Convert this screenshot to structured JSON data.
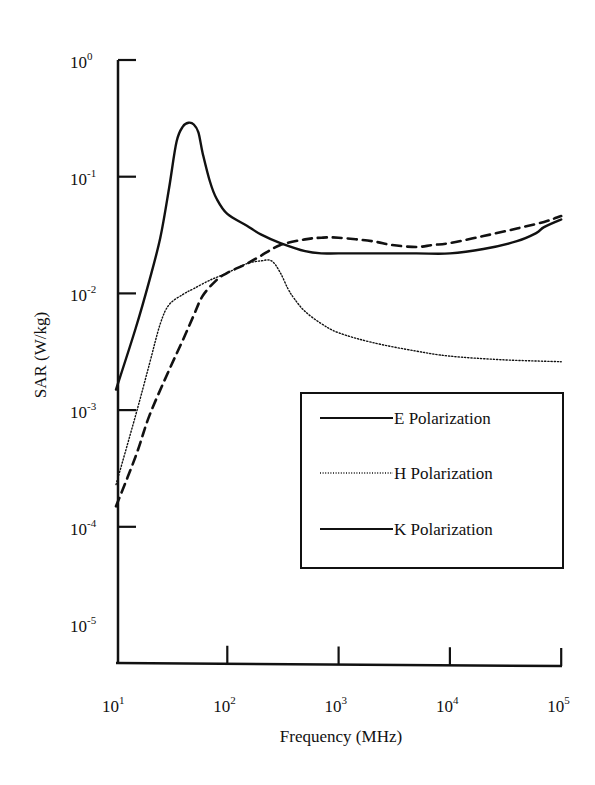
{
  "chart_data": {
    "type": "line",
    "title": "",
    "xlabel": "Frequency (MHz)",
    "ylabel": "SAR (W/kg)",
    "xscale": "log",
    "yscale": "log",
    "xlim": [
      10,
      100000
    ],
    "ylim": [
      1e-05,
      1
    ],
    "x_ticks": [
      {
        "value": 10,
        "base": "10",
        "exp": "1"
      },
      {
        "value": 100,
        "base": "10",
        "exp": "2"
      },
      {
        "value": 1000,
        "base": "10",
        "exp": "3"
      },
      {
        "value": 10000,
        "base": "10",
        "exp": "4"
      },
      {
        "value": 100000,
        "base": "10",
        "exp": "5"
      }
    ],
    "y_ticks": [
      {
        "value": 1,
        "base": "10",
        "exp": "0"
      },
      {
        "value": 0.1,
        "base": "10",
        "exp": "-1"
      },
      {
        "value": 0.01,
        "base": "10",
        "exp": "-2"
      },
      {
        "value": 0.001,
        "base": "10",
        "exp": "-3"
      },
      {
        "value": 0.0001,
        "base": "10",
        "exp": "-4"
      },
      {
        "value": 1e-05,
        "base": "10",
        "exp": "-5"
      }
    ],
    "grid": false,
    "legend_position": "lower-right inside",
    "series": [
      {
        "name": "E Polarization",
        "style": "solid",
        "x": [
          10,
          15,
          20,
          25,
          30,
          35,
          40,
          45,
          50,
          55,
          60,
          70,
          80,
          100,
          150,
          200,
          300,
          500,
          700,
          1000,
          2000,
          5000,
          10000,
          20000,
          40000,
          60000,
          70000,
          100000
        ],
        "y": [
          0.0015,
          0.005,
          0.013,
          0.03,
          0.08,
          0.2,
          0.27,
          0.29,
          0.28,
          0.24,
          0.16,
          0.09,
          0.065,
          0.048,
          0.038,
          0.032,
          0.027,
          0.023,
          0.022,
          0.022,
          0.022,
          0.022,
          0.022,
          0.024,
          0.028,
          0.033,
          0.037,
          0.043
        ]
      },
      {
        "name": "H Polarization",
        "style": "dotted",
        "x": [
          10,
          15,
          20,
          25,
          30,
          40,
          50,
          70,
          100,
          150,
          200,
          250,
          300,
          350,
          400,
          500,
          700,
          1000,
          2000,
          5000,
          10000,
          30000,
          100000
        ],
        "y": [
          0.00023,
          0.0009,
          0.0025,
          0.0055,
          0.008,
          0.0098,
          0.011,
          0.013,
          0.015,
          0.018,
          0.019,
          0.019,
          0.015,
          0.011,
          0.009,
          0.007,
          0.0055,
          0.0046,
          0.0038,
          0.0032,
          0.0029,
          0.0027,
          0.0026
        ]
      },
      {
        "name": "K Polarization",
        "style": "dashed",
        "x": [
          10,
          15,
          20,
          30,
          40,
          50,
          60,
          80,
          100,
          150,
          200,
          300,
          500,
          700,
          1000,
          2000,
          3000,
          5000,
          7000,
          10000,
          20000,
          40000,
          70000,
          100000
        ],
        "y": [
          0.00015,
          0.0004,
          0.0009,
          0.0022,
          0.004,
          0.0065,
          0.0095,
          0.013,
          0.015,
          0.018,
          0.021,
          0.026,
          0.029,
          0.03,
          0.03,
          0.028,
          0.026,
          0.025,
          0.026,
          0.027,
          0.031,
          0.036,
          0.041,
          0.046
        ]
      }
    ],
    "legend": [
      {
        "label": "E Polarization",
        "style": "solid"
      },
      {
        "label": "H Polarization",
        "style": "dotted"
      },
      {
        "label": "K Polarization",
        "style": "solid"
      }
    ]
  }
}
